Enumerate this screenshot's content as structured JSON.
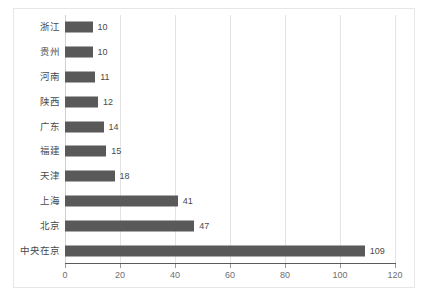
{
  "chart_data": {
    "type": "bar",
    "orientation": "horizontal",
    "title": "",
    "xlabel": "",
    "ylabel": "",
    "categories": [
      "浙江",
      "贵州",
      "河南",
      "陕西",
      "广东",
      "福建",
      "天津",
      "上海",
      "北京",
      "中央在京"
    ],
    "values": [
      10,
      10,
      11,
      12,
      14,
      15,
      18,
      41,
      47,
      109
    ],
    "xlim": [
      0,
      120
    ],
    "xticks": [
      0,
      20,
      40,
      60,
      80,
      100,
      120
    ],
    "xtick_labels": [
      "0",
      "20",
      "40",
      "60",
      "80",
      "100",
      "120"
    ],
    "grid": true,
    "grid_axis": "x",
    "legend": false,
    "data_labels": true,
    "bar_color": "#595959",
    "gridline_color": "#e3e3e3",
    "axis_color": "#5a5a5a",
    "frame_color": "#e6e6e6",
    "label_color": "#4a4a4a",
    "tick_label_color": "#6e6e6e"
  },
  "caption": ""
}
